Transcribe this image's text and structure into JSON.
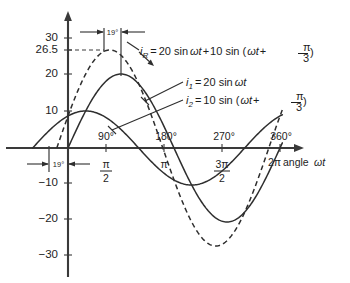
{
  "chart_data": {
    "type": "line",
    "title": "",
    "xlabel": "angle ωt",
    "ylabel": "",
    "xlim": [
      -60,
      380
    ],
    "ylim": [
      -34,
      32
    ],
    "grid": false,
    "legend": "inline-annotations",
    "x_unit": "degrees",
    "x_ticks_deg": [
      90,
      180,
      270,
      360
    ],
    "x_tick_labels_deg": [
      "90°",
      "180°",
      "270°",
      "360°"
    ],
    "x_tick_labels_rad_num": [
      "π",
      "π",
      "3π",
      "2π"
    ],
    "x_tick_labels_rad_den": [
      "2",
      "",
      "2",
      ""
    ],
    "y_ticks": [
      30,
      26.5,
      20,
      10,
      -10,
      -20,
      -30
    ],
    "y_tick_labels": [
      "30",
      "26.5",
      "20",
      "10",
      "−10",
      "−20",
      "−30"
    ],
    "series": [
      {
        "name": "i1",
        "label": "i₁ = 20 sin ωt",
        "amplitude": 20,
        "phase_deg": 0,
        "style": "solid"
      },
      {
        "name": "i2",
        "label": "i₂ = 10 sin(ωt + π/3)",
        "amplitude": 10,
        "phase_deg": 60,
        "style": "solid"
      },
      {
        "name": "iR",
        "label": "iᴿ = 20 sin ωt + 10 sin(ωt + π/3)",
        "amplitude": 26.5,
        "phase_deg": 19,
        "style": "dashed"
      }
    ],
    "annotations": [
      {
        "name": "phase-shift-top",
        "text": "19°",
        "value": 19
      },
      {
        "name": "phase-shift-bottom",
        "text": "19°",
        "value": 19
      },
      {
        "name": "peak-guide",
        "text": "26.5",
        "value": 26.5
      }
    ]
  },
  "equations": {
    "ir": {
      "lhs_var": "i",
      "lhs_sub": "R",
      "eq": "=",
      "rhs_a": "20 sin",
      "omega_t": "ωt",
      "plus": "+",
      "rhs_b": "10 sin (",
      "omega_t2": "ωt",
      "plus2": "+",
      "frac_num": "π",
      "frac_den": "3",
      "close": ")"
    },
    "i1": {
      "lhs_var": "i",
      "lhs_sub": "1",
      "eq": "=",
      "rhs": "20 sin",
      "omega_t": "ωt"
    },
    "i2": {
      "lhs_var": "i",
      "lhs_sub": "2",
      "eq": "=",
      "rhs": "10 sin (",
      "omega_t": "ωt",
      "plus": "+",
      "frac_num": "π",
      "frac_den": "3",
      "close": ")"
    }
  },
  "axis": {
    "x_title_prefix": "2π",
    "x_title_word": "angle",
    "x_title_var": "ωt"
  },
  "y_labels": {
    "t30": "30",
    "t265": "26.5",
    "t20": "20",
    "t10": "10",
    "m10": "−10",
    "m20": "−20",
    "m30": "−30"
  },
  "x_labels": {
    "d90": "90°",
    "d180": "180°",
    "d270": "270°",
    "d360": "360°",
    "f90_num": "π",
    "f90_den": "2",
    "f180": "π",
    "f270_num": "3π",
    "f270_den": "2"
  },
  "markers": {
    "top_19": "19°",
    "bottom_19": "19°"
  },
  "colors": {
    "curve": "#2e2e2e",
    "axis": "#3a3a3a",
    "text": "#1d1d1d",
    "background": "#ffffff"
  }
}
